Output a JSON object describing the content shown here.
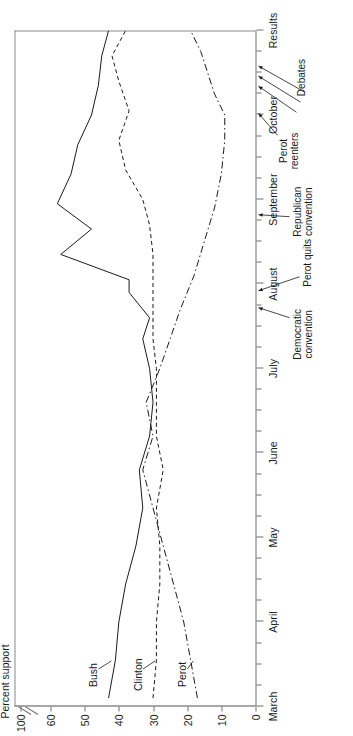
{
  "chart_data": {
    "type": "line",
    "title": "",
    "xlabel": "",
    "ylabel": "Percent support",
    "ylim": [
      0,
      100
    ],
    "y_break": true,
    "y_break_between": [
      60,
      100
    ],
    "yticks": [
      0,
      10,
      20,
      30,
      40,
      50,
      60,
      100
    ],
    "ytick_labels": [
      "0",
      "10",
      "20",
      "30",
      "40",
      "50",
      "60",
      "100"
    ],
    "x_categories": [
      "March",
      "April",
      "May",
      "June",
      "July",
      "August",
      "September",
      "October",
      "Results"
    ],
    "grid": false,
    "legend": "direct-labels",
    "series": [
      {
        "name": "Bush",
        "style": "solid",
        "color": "#1a1a1a",
        "points": [
          {
            "x": 0.1,
            "v": 43
          },
          {
            "x": 0.55,
            "v": 41
          },
          {
            "x": 1.0,
            "v": 40
          },
          {
            "x": 1.45,
            "v": 38
          },
          {
            "x": 1.9,
            "v": 35
          },
          {
            "x": 2.35,
            "v": 33
          },
          {
            "x": 2.8,
            "v": 34
          },
          {
            "x": 3.2,
            "v": 31
          },
          {
            "x": 3.6,
            "v": 30
          },
          {
            "x": 4.0,
            "v": 31
          },
          {
            "x": 4.35,
            "v": 33
          },
          {
            "x": 4.6,
            "v": 31
          },
          {
            "x": 4.9,
            "v": 37
          },
          {
            "x": 5.05,
            "v": 37
          },
          {
            "x": 5.35,
            "v": 57
          },
          {
            "x": 5.65,
            "v": 48
          },
          {
            "x": 5.95,
            "v": 58
          },
          {
            "x": 6.3,
            "v": 54
          },
          {
            "x": 6.65,
            "v": 52
          },
          {
            "x": 7.0,
            "v": 48
          },
          {
            "x": 7.35,
            "v": 46
          },
          {
            "x": 7.7,
            "v": 45
          },
          {
            "x": 8.0,
            "v": 43
          }
        ]
      },
      {
        "name": "Clinton",
        "style": "dashed",
        "color": "#1a1a1a",
        "points": [
          {
            "x": 0.1,
            "v": 30
          },
          {
            "x": 0.55,
            "v": 29
          },
          {
            "x": 1.0,
            "v": 29
          },
          {
            "x": 1.45,
            "v": 28
          },
          {
            "x": 1.9,
            "v": 28
          },
          {
            "x": 2.35,
            "v": 29
          },
          {
            "x": 2.8,
            "v": 27
          },
          {
            "x": 3.2,
            "v": 29
          },
          {
            "x": 3.6,
            "v": 29
          },
          {
            "x": 4.0,
            "v": 29
          },
          {
            "x": 4.35,
            "v": 30
          },
          {
            "x": 4.7,
            "v": 30
          },
          {
            "x": 5.0,
            "v": 30
          },
          {
            "x": 5.35,
            "v": 30
          },
          {
            "x": 5.7,
            "v": 31
          },
          {
            "x": 6.0,
            "v": 33
          },
          {
            "x": 6.35,
            "v": 38
          },
          {
            "x": 6.7,
            "v": 40
          },
          {
            "x": 7.05,
            "v": 37
          },
          {
            "x": 7.4,
            "v": 40
          },
          {
            "x": 7.7,
            "v": 42
          },
          {
            "x": 8.0,
            "v": 38
          }
        ]
      },
      {
        "name": "Perot",
        "style": "dashdot",
        "color": "#1a1a1a",
        "points": [
          {
            "x": 0.1,
            "v": 17
          },
          {
            "x": 0.55,
            "v": 19
          },
          {
            "x": 1.0,
            "v": 21
          },
          {
            "x": 1.45,
            "v": 24
          },
          {
            "x": 1.9,
            "v": 27
          },
          {
            "x": 2.35,
            "v": 30
          },
          {
            "x": 2.8,
            "v": 33
          },
          {
            "x": 3.2,
            "v": 30
          },
          {
            "x": 3.6,
            "v": 32
          },
          {
            "x": 4.0,
            "v": 28
          },
          {
            "x": 4.35,
            "v": 25
          },
          {
            "x": 4.7,
            "v": 22
          },
          {
            "x": 5.1,
            "v": 18
          },
          {
            "x": 5.5,
            "v": 15
          },
          {
            "x": 5.9,
            "v": 12
          },
          {
            "x": 6.3,
            "v": 10
          },
          {
            "x": 6.7,
            "v": 9
          },
          {
            "x": 7.0,
            "v": 9
          },
          {
            "x": 7.25,
            "v": 12
          },
          {
            "x": 7.5,
            "v": 14
          },
          {
            "x": 7.75,
            "v": 16
          },
          {
            "x": 8.0,
            "v": 19
          }
        ]
      }
    ],
    "annotations": [
      {
        "id": "democratic-convention",
        "label": "Democratic\nconvention",
        "x": 4.72
      },
      {
        "id": "perot-quits",
        "label": "Perot quits",
        "x": 4.92
      },
      {
        "id": "republican-convention",
        "label": "Republican\nconvention",
        "x": 5.82
      },
      {
        "id": "perot-reenters",
        "label": "Perot\nreenters",
        "x": 7.02
      },
      {
        "id": "debate-1",
        "label": "Debates",
        "x": 7.34
      },
      {
        "id": "debate-2",
        "label": "",
        "x": 7.46
      },
      {
        "id": "debate-3",
        "label": "",
        "x": 7.58
      }
    ]
  },
  "labels": {
    "y_title": "Percent support",
    "series_bush": "Bush",
    "series_clinton": "Clinton",
    "series_perot": "Perot",
    "anno_democratic": "Democratic",
    "anno_convention1": "convention",
    "anno_perot_quits": "Perot quits",
    "anno_republican": "Republican",
    "anno_convention2": "convention",
    "anno_perot": "Perot",
    "anno_reenters": "reenters",
    "anno_debates": "Debates"
  }
}
